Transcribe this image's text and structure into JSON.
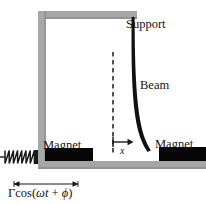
{
  "figure": {
    "width": 206,
    "height": 204,
    "background": "#ffffff"
  },
  "labels": {
    "support": "Support",
    "beam": "Beam",
    "magnet_left": "Magnet",
    "magnet_right": "Magnet",
    "displacement": "x",
    "drive_gamma": "Γ",
    "drive_cos_open": "cos(",
    "drive_omega": "ω",
    "drive_t": "t",
    "drive_plus": " + ",
    "drive_phi": "ϕ",
    "drive_close": ")"
  },
  "colors": {
    "frame_gray": "#a5a5a5",
    "frame_gray_dark": "#9a9a9a",
    "beam_black": "#111111",
    "magnet_black": "#050505",
    "spring_black": "#1a1a1a",
    "text_black": "#161616",
    "background": "#ffffff"
  },
  "geometry": {
    "frame": {
      "top_bar": {
        "x": 38,
        "y": 11,
        "w": 99,
        "h": 8
      },
      "left_post": {
        "x": 38,
        "y": 11,
        "w": 8,
        "h": 150
      },
      "base_bar": {
        "x": 38,
        "y": 161,
        "w": 168,
        "h": 8
      }
    },
    "magnet_left": {
      "x": 45,
      "y": 148,
      "w": 48,
      "h": 13
    },
    "magnet_right": {
      "x": 159,
      "y": 147,
      "w": 47,
      "h": 14
    },
    "beam": {
      "start": [
        133,
        18
      ],
      "control": [
        133,
        118
      ],
      "end": [
        148,
        152
      ],
      "thickness_top": 2.4,
      "thickness_bottom": 4.2
    },
    "dashed_reference_line": {
      "x": 113,
      "y_top": 52,
      "y_bottom": 155
    },
    "displacement_arrow": {
      "x_start": 113,
      "x_end": 134,
      "y": 142
    },
    "drive_arrow": {
      "x_start": 14,
      "x_end": 78,
      "y": 184
    },
    "spring": {
      "x": 3,
      "y": 150,
      "w": 35,
      "h": 14,
      "coils": 6
    }
  }
}
